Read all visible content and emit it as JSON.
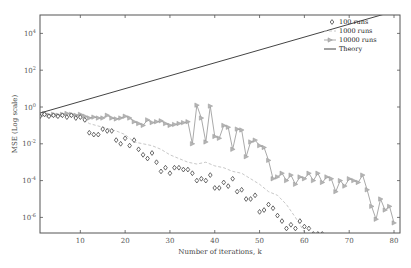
{
  "chart_data": {
    "type": "line",
    "title": "",
    "xlabel": "Number of iterations, k",
    "ylabel": "MSE (Log scale)",
    "xlim": [
      1,
      80
    ],
    "ylim_log10": [
      -7.0,
      5.0
    ],
    "yscale": "log",
    "xticks": [
      10,
      20,
      30,
      40,
      50,
      60,
      70,
      80
    ],
    "yticks": [
      "10^4",
      "10^2",
      "10^0",
      "10^-2",
      "10^-4",
      "10^-6"
    ],
    "ytick_exponents": [
      4,
      2,
      0,
      -2,
      -4,
      -6
    ],
    "grid": false,
    "legend_position": "upper right",
    "legend": [
      "100 runs",
      "1000 runs",
      "10000 runs",
      "Theory"
    ],
    "series": [
      {
        "name": "100 runs",
        "style": "diamond markers, no line",
        "x": [
          1,
          2,
          3,
          4,
          5,
          6,
          7,
          8,
          9,
          10,
          11,
          12,
          13,
          14,
          15,
          16,
          17,
          18,
          19,
          20,
          21,
          22,
          23,
          24,
          25,
          26,
          27,
          28,
          29,
          30,
          31,
          32,
          33,
          34,
          35,
          36,
          37,
          38,
          39,
          40,
          41,
          42,
          43,
          44,
          45,
          46,
          47,
          48,
          49,
          50,
          51,
          52,
          53,
          54,
          55,
          56,
          57,
          58,
          59,
          60,
          61,
          62,
          63,
          64
        ],
        "log10_values": [
          -0.5,
          -0.4,
          -0.5,
          -0.45,
          -0.5,
          -0.45,
          -0.55,
          -0.45,
          -0.6,
          -0.55,
          -0.7,
          -1.4,
          -1.5,
          -1.5,
          -1.2,
          -1.3,
          -1.3,
          -1.8,
          -2.0,
          -1.7,
          -2.1,
          -1.8,
          -2.3,
          -2.6,
          -2.8,
          -2.5,
          -3.0,
          -3.5,
          -3.3,
          -3.6,
          -3.3,
          -3.3,
          -3.4,
          -3.4,
          -3.6,
          -4.0,
          -3.9,
          -4.0,
          -3.7,
          -4.4,
          -4.4,
          -4.1,
          -4.3,
          -3.9,
          -4.6,
          -4.5,
          -5.0,
          -5.0,
          -4.8,
          -5.7,
          -5.6,
          -5.3,
          -5.5,
          -5.9,
          -6.2,
          -6.6,
          -6.4,
          -6.6,
          -6.2,
          -6.5,
          -6.6,
          -6.9,
          -6.9,
          -6.9
        ]
      },
      {
        "name": "1000 runs",
        "style": "dashed line",
        "x": [
          1,
          5,
          10,
          12,
          15,
          18,
          20,
          22,
          24,
          26,
          28,
          30,
          32,
          34,
          36,
          38,
          40,
          42,
          44,
          46,
          48,
          50,
          52,
          54,
          56,
          58,
          60
        ],
        "log10_values": [
          -0.5,
          -0.45,
          -0.55,
          -0.9,
          -1.1,
          -1.3,
          -1.5,
          -1.9,
          -2.0,
          -2.1,
          -2.3,
          -2.6,
          -2.8,
          -3.0,
          -3.1,
          -3.0,
          -3.2,
          -3.3,
          -3.5,
          -3.6,
          -3.9,
          -4.2,
          -4.6,
          -4.8,
          -5.3,
          -6.0,
          -6.8
        ]
      },
      {
        "name": "10000 runs",
        "style": "solid line with right-pointing triangle markers",
        "x": [
          1,
          2,
          3,
          4,
          5,
          6,
          7,
          8,
          9,
          10,
          11,
          12,
          13,
          14,
          15,
          16,
          17,
          18,
          19,
          20,
          21,
          22,
          23,
          24,
          25,
          26,
          27,
          28,
          29,
          30,
          31,
          32,
          33,
          34,
          35,
          36,
          37,
          38,
          39,
          40,
          41,
          42,
          43,
          44,
          45,
          46,
          47,
          48,
          49,
          50,
          51,
          52,
          53,
          54,
          55,
          56,
          57,
          58,
          59,
          60,
          61,
          62,
          63,
          64,
          65,
          66,
          67,
          68,
          69,
          70,
          71,
          72,
          73,
          74,
          75,
          76,
          77,
          78,
          79,
          80
        ],
        "log10_values": [
          -0.5,
          -0.35,
          -0.45,
          -0.4,
          -0.45,
          -0.4,
          -0.35,
          -0.4,
          -0.45,
          -0.4,
          -0.5,
          -0.6,
          -0.55,
          -0.6,
          -0.6,
          -0.45,
          -0.6,
          -0.65,
          -0.6,
          -0.5,
          -0.6,
          -0.8,
          -0.9,
          -1.0,
          -0.7,
          -0.85,
          -0.8,
          -0.75,
          -0.9,
          -1.0,
          -0.95,
          -0.9,
          -0.85,
          -0.8,
          -2.0,
          0.1,
          -0.6,
          -1.9,
          0.05,
          -1.6,
          -1.7,
          -1.0,
          -1.1,
          -2.3,
          -1.2,
          -1.25,
          -2.7,
          -1.9,
          -1.8,
          -2.1,
          -2.2,
          -2.9,
          -3.9,
          -3.8,
          -3.6,
          -4.0,
          -3.7,
          -4.2,
          -3.8,
          -3.9,
          -3.6,
          -4.0,
          -3.6,
          -4.1,
          -3.8,
          -3.9,
          -4.6,
          -4.0,
          -4.3,
          -3.9,
          -4.0,
          -4.1,
          -3.7,
          -4.5,
          -5.4,
          -6.1,
          -5.0,
          -5.6,
          -5.4,
          -6.3
        ]
      },
      {
        "name": "Theory",
        "style": "solid dark line",
        "x": [
          1,
          80
        ],
        "log10_values": [
          -0.33,
          5.2
        ]
      }
    ]
  }
}
